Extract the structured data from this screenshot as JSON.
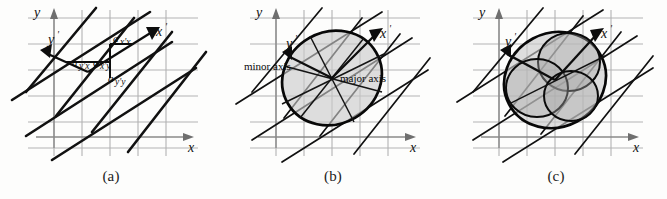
{
  "figure": {
    "background_color": "#fdfdfc",
    "grid_color": "#b3b3b3",
    "axis_color": "#8a8a8a",
    "rotated_line_color": "#111111",
    "shade_color": "#c9c9c9"
  },
  "panels": [
    {
      "id": "a",
      "caption": "(a)",
      "axes": {
        "x_label": "x",
        "y_label": "y",
        "x_prime_label": "x",
        "x_prime_mark": "'",
        "y_prime_label": "y",
        "y_prime_mark": "'"
      },
      "coefficients": [
        {
          "name": "a-x-prime-x",
          "base": "a",
          "sub": "x'x"
        },
        {
          "name": "a-y-prime-x",
          "base": "a",
          "sub": "y'x"
        },
        {
          "name": "a-x-prime-y",
          "base": "a",
          "sub": "x'y"
        },
        {
          "name": "a-y-prime-y",
          "base": "a",
          "sub": "y'y"
        }
      ]
    },
    {
      "id": "b",
      "caption": "(b)",
      "axes": {
        "x_label": "x",
        "y_label": "y",
        "x_prime_label": "x",
        "x_prime_mark": "'",
        "y_prime_label": "y",
        "y_prime_mark": "'"
      },
      "annotations": {
        "minor_axis": "minor axis",
        "major_axis": "major axis"
      }
    },
    {
      "id": "c",
      "caption": "(c)",
      "axes": {
        "x_label": "x",
        "y_label": "y",
        "x_prime_label": "x",
        "x_prime_mark": "'",
        "y_prime_label": "y",
        "y_prime_mark": "'"
      },
      "inner_shape_count": 3
    }
  ]
}
